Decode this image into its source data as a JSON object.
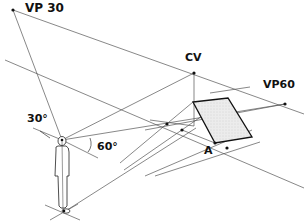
{
  "diagram": {
    "type": "two-point perspective construction",
    "labels": {
      "vp_left": "VP 30",
      "center_of_vision": "CV",
      "vp_right": "VP60",
      "angle_left": "30°",
      "angle_right": "60°",
      "point_a": "A"
    },
    "points": {
      "vp30": [
        13,
        10
      ],
      "cv": [
        194,
        73
      ],
      "vp60": [
        285,
        104
      ],
      "eye": [
        62,
        140
      ],
      "feet": [
        64,
        212
      ],
      "a": [
        215,
        143
      ],
      "measure_1": [
        167,
        124
      ],
      "measure_2": [
        182,
        130
      ],
      "measure_3": [
        227,
        148
      ]
    },
    "shaded_plane": {
      "corners": [
        [
          193,
          102
        ],
        [
          228,
          98
        ],
        [
          252,
          137
        ],
        [
          215,
          143
        ]
      ],
      "fill": "#e6e6e6",
      "stroke": "#111111"
    },
    "colors": {
      "line": "#555555",
      "heavy_line": "#111111",
      "text": "#111111",
      "background": "#ffffff"
    }
  }
}
